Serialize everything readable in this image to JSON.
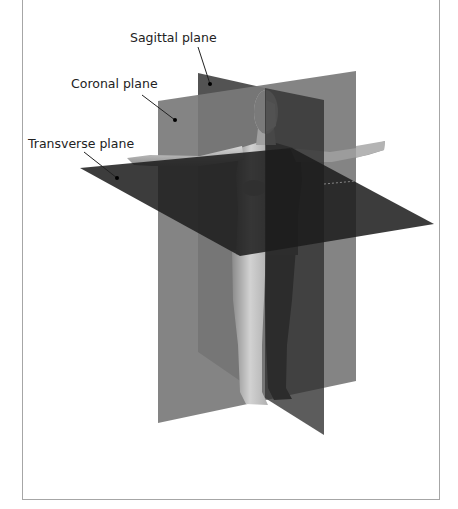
{
  "diagram": {
    "labels": {
      "sagittal": "Sagittal plane",
      "coronal": "Coronal plane",
      "transverse": "Transverse plane"
    },
    "colors": {
      "background": "#ffffff",
      "frame_border": "#a6a6a6",
      "text": "#222222",
      "coronal_plane": "#6e6e6e",
      "sagittal_plane": "#3a3a3a",
      "transverse_plane": "#1e1e1e",
      "skin_lit": "#c8c8c8",
      "skin_shadow": "#2a2a2a"
    }
  }
}
